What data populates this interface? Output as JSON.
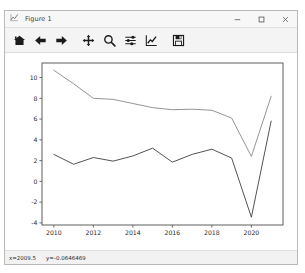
{
  "window": {
    "title": "Figure 1",
    "title_icon": "figure-icon",
    "controls": [
      {
        "name": "minimize-button",
        "glyph": "minimize-icon"
      },
      {
        "name": "maximize-button",
        "glyph": "maximize-icon"
      },
      {
        "name": "close-button",
        "glyph": "close-icon"
      }
    ]
  },
  "toolbar": {
    "buttons": [
      {
        "name": "home-button",
        "icon": "home-icon",
        "tooltip": "Reset original view"
      },
      {
        "name": "back-button",
        "icon": "arrow-left-icon",
        "tooltip": "Back to previous view"
      },
      {
        "name": "forward-button",
        "icon": "arrow-right-icon",
        "tooltip": "Forward to next view"
      },
      {
        "name": "pan-button",
        "icon": "move-cross-icon",
        "tooltip": "Pan axes with left mouse, zoom with right"
      },
      {
        "name": "zoom-button",
        "icon": "magnifier-icon",
        "tooltip": "Zoom to rectangle"
      },
      {
        "name": "configure-subplots-button",
        "icon": "sliders-icon",
        "tooltip": "Configure subplots"
      },
      {
        "name": "edit-axis-button",
        "icon": "chart-line-icon",
        "tooltip": "Edit axis, curve and image parameters"
      },
      {
        "name": "save-button",
        "icon": "floppy-disk-icon",
        "tooltip": "Save the figure"
      }
    ]
  },
  "statusbar": {
    "x_readout": "x=2009.5",
    "y_readout": "y=-0.0646469"
  },
  "chart_data": {
    "type": "line",
    "title": "",
    "xlabel": "",
    "ylabel": "",
    "xlim": [
      2009.4,
      2021.6
    ],
    "ylim": [
      -4.2,
      11.4
    ],
    "xticks": [
      2010,
      2012,
      2014,
      2016,
      2018,
      2020
    ],
    "yticks": [
      -4,
      -2,
      0,
      2,
      4,
      6,
      8,
      10
    ],
    "grid": false,
    "legend": "none",
    "x": [
      2010,
      2011,
      2012,
      2013,
      2014,
      2015,
      2016,
      2017,
      2018,
      2019,
      2020,
      2021
    ],
    "series": [
      {
        "name": "upper-line",
        "color": "#8f8f8f",
        "values": [
          10.7,
          9.4,
          8.0,
          7.9,
          7.5,
          7.1,
          6.9,
          6.95,
          6.85,
          6.1,
          2.4,
          8.2
        ]
      },
      {
        "name": "lower-line",
        "color": "#4a4a4a",
        "values": [
          2.6,
          1.65,
          2.3,
          1.95,
          2.45,
          3.2,
          1.85,
          2.6,
          3.1,
          2.25,
          -3.45,
          5.8
        ]
      }
    ]
  },
  "style": {
    "axes_edge_color": "#4d4d4d",
    "tick_label_color": "#2b2b2b",
    "canvas_background": "#ffffff"
  }
}
